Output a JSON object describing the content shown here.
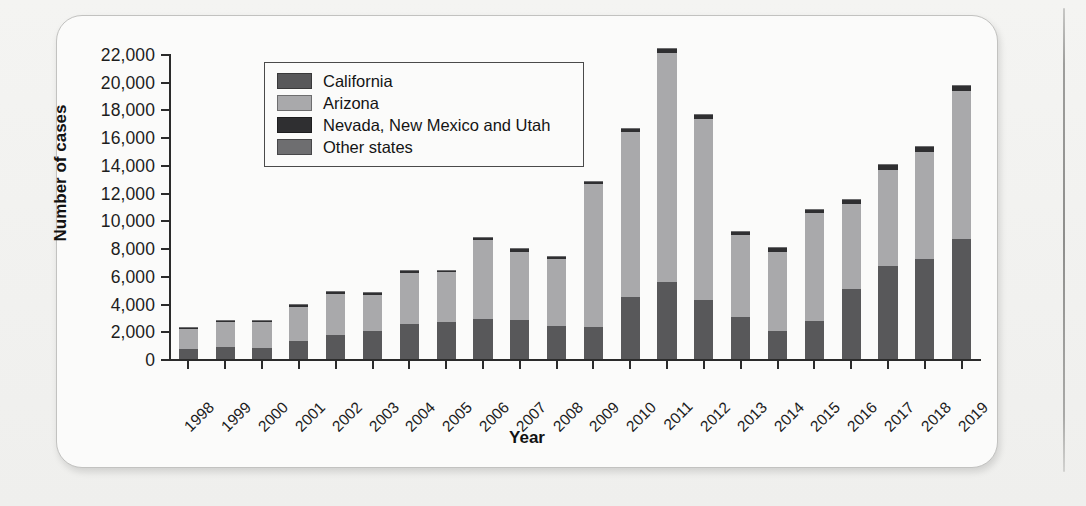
{
  "chart_data": {
    "type": "bar",
    "subtype": "stacked-vertical",
    "title": "",
    "xlabel": "Year",
    "ylabel": "Number of cases",
    "ylim": [
      0,
      22000
    ],
    "ytick_step": 2000,
    "ytick_labels": [
      "22,000",
      "20,000",
      "18,000",
      "16,000",
      "14,000",
      "12,000",
      "10,000",
      "8,000",
      "6,000",
      "4,000",
      "2,000",
      "0"
    ],
    "ytick_values": [
      22000,
      20000,
      18000,
      16000,
      14000,
      12000,
      10000,
      8000,
      6000,
      4000,
      2000,
      0
    ],
    "grid": false,
    "legend_position": "upper-left-inside",
    "categories": [
      "1998",
      "1999",
      "2000",
      "2001",
      "2002",
      "2003",
      "2004",
      "2005",
      "2006",
      "2007",
      "2008",
      "2009",
      "2010",
      "2011",
      "2012",
      "2013",
      "2014",
      "2015",
      "2016",
      "2017",
      "2018",
      "2019"
    ],
    "series": [
      {
        "name": "California",
        "color": "#58585a",
        "values": [
          700,
          900,
          800,
          1300,
          1700,
          2050,
          2500,
          2700,
          2900,
          2800,
          2400,
          2300,
          4450,
          5550,
          4250,
          3000,
          2050,
          2750,
          5050,
          6700,
          7200,
          8650
        ]
      },
      {
        "name": "Arizona",
        "color": "#a9a9ab",
        "values": [
          1450,
          1750,
          1850,
          2450,
          3000,
          2550,
          3700,
          3550,
          5650,
          4950,
          4800,
          10350,
          11900,
          16550,
          13050,
          5950,
          5700,
          7750,
          6150,
          6950,
          7750,
          10700
        ]
      },
      {
        "name": "Nevada, New Mexico and Utah",
        "color": "#2f2f31",
        "values": [
          100,
          100,
          100,
          150,
          150,
          150,
          150,
          150,
          200,
          200,
          200,
          150,
          250,
          300,
          300,
          250,
          250,
          300,
          300,
          350,
          350,
          400
        ]
      },
      {
        "name": "Other states",
        "color": "#6e6e70",
        "values": [
          50,
          50,
          50,
          50,
          50,
          50,
          50,
          50,
          50,
          50,
          50,
          50,
          50,
          50,
          50,
          50,
          50,
          50,
          50,
          50,
          50,
          50
        ]
      }
    ],
    "totals": [
      2300,
      2800,
      2800,
      3950,
      4900,
      4800,
      6400,
      6450,
      8800,
      8000,
      7450,
      12850,
      16650,
      22450,
      17650,
      9250,
      8050,
      10850,
      11550,
      14050,
      15350,
      19800
    ]
  },
  "legend": {
    "entries": [
      {
        "label": "California",
        "color": "#58585a"
      },
      {
        "label": "Arizona",
        "color": "#a9a9ab"
      },
      {
        "label": "Nevada, New Mexico and Utah",
        "color": "#2f2f31"
      },
      {
        "label": "Other states",
        "color": "#6e6e70"
      }
    ]
  },
  "axes": {
    "y_title": "Number of cases",
    "x_title": "Year"
  }
}
